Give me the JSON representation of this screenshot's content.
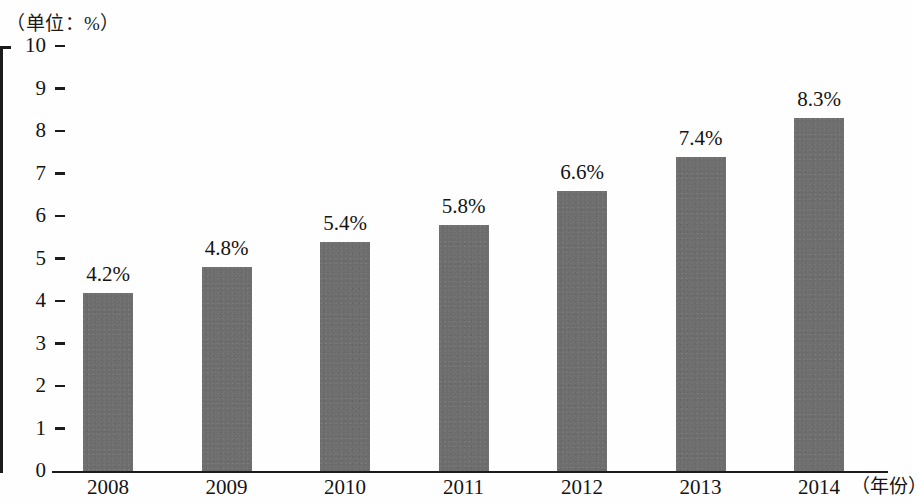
{
  "unit_caption": "（单位：%）",
  "axis_title_x": "（年份）",
  "colors": {
    "bar_fill": "#6d6d6d",
    "axis": "#1c1c1c",
    "text": "#141414",
    "background": "#fefefe"
  },
  "y_axis": {
    "ticks": [
      "0",
      "1",
      "2",
      "3",
      "4",
      "5",
      "6",
      "7",
      "8",
      "9",
      "10"
    ]
  },
  "chart_data": {
    "type": "bar",
    "title": "",
    "subtitle": "",
    "xlabel": "（年份）",
    "ylabel": "（单位：%）",
    "categories": [
      "2008",
      "2009",
      "2010",
      "2011",
      "2012",
      "2013",
      "2014"
    ],
    "values": [
      4.2,
      4.8,
      5.4,
      5.8,
      6.6,
      7.4,
      8.3
    ],
    "data_labels": [
      "4.2%",
      "4.8%",
      "5.4%",
      "5.8%",
      "6.6%",
      "7.4%",
      "8.3%"
    ],
    "ylim": [
      0,
      10
    ],
    "ytick_step": 1,
    "grid": false,
    "legend": null,
    "series": [
      {
        "name": "",
        "values": [
          4.2,
          4.8,
          5.4,
          5.8,
          6.6,
          7.4,
          8.3
        ]
      }
    ]
  }
}
